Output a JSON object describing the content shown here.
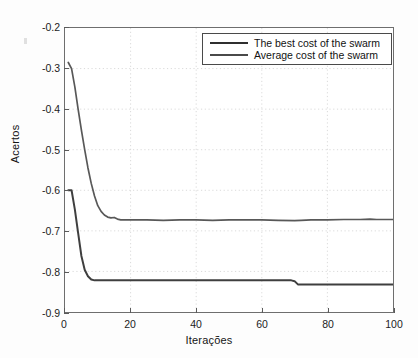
{
  "chart_data": {
    "type": "line",
    "title": "",
    "xlabel": "Iterações",
    "ylabel": "Acertos",
    "xlim": [
      0,
      100
    ],
    "ylim": [
      -0.9,
      -0.2
    ],
    "xticks": [
      0,
      20,
      40,
      60,
      80,
      100
    ],
    "yticks": [
      -0.2,
      -0.3,
      -0.4,
      -0.5,
      -0.6,
      -0.7,
      -0.8,
      -0.9
    ],
    "xtick_labels": [
      "0",
      "20",
      "40",
      "60",
      "80",
      "100"
    ],
    "ytick_labels": [
      "-0.2",
      "-0.3",
      "-0.4",
      "-0.5",
      "-0.6",
      "-0.7",
      "-0.8",
      "-0.9"
    ],
    "grid": true,
    "grid_style": "dotted",
    "legend_position": "top-right",
    "legend_boxed": true,
    "line_color": "#3c3c3c",
    "axis_color": "#6e6e6e",
    "background_color": "#ffffff",
    "series": [
      {
        "name": "The best cost of the swarm",
        "color": "#2f2f2f",
        "x": [
          1,
          2,
          3,
          4,
          5,
          6,
          7,
          8,
          9,
          10,
          12,
          15,
          20,
          25,
          30,
          35,
          40,
          45,
          50,
          55,
          60,
          65,
          69,
          70,
          71,
          75,
          80,
          85,
          90,
          95,
          100
        ],
        "values": [
          -0.6,
          -0.6,
          -0.647,
          -0.705,
          -0.762,
          -0.796,
          -0.812,
          -0.82,
          -0.822,
          -0.822,
          -0.822,
          -0.822,
          -0.822,
          -0.822,
          -0.822,
          -0.822,
          -0.822,
          -0.822,
          -0.822,
          -0.822,
          -0.822,
          -0.822,
          -0.822,
          -0.824,
          -0.832,
          -0.832,
          -0.832,
          -0.832,
          -0.832,
          -0.832,
          -0.832
        ]
      },
      {
        "name": "Average cost of the swarm",
        "color": "#4a4a4a",
        "x": [
          1,
          2,
          3,
          4,
          5,
          6,
          7,
          8,
          9,
          10,
          11,
          12,
          13,
          14,
          15,
          16,
          17,
          18,
          20,
          25,
          30,
          35,
          40,
          45,
          50,
          55,
          60,
          65,
          70,
          72,
          75,
          80,
          85,
          90,
          93,
          95,
          98,
          100
        ],
        "values": [
          -0.285,
          -0.3,
          -0.345,
          -0.4,
          -0.452,
          -0.5,
          -0.545,
          -0.583,
          -0.614,
          -0.638,
          -0.652,
          -0.661,
          -0.666,
          -0.668,
          -0.667,
          -0.671,
          -0.673,
          -0.673,
          -0.673,
          -0.673,
          -0.674,
          -0.673,
          -0.673,
          -0.674,
          -0.673,
          -0.673,
          -0.673,
          -0.674,
          -0.675,
          -0.674,
          -0.673,
          -0.673,
          -0.672,
          -0.672,
          -0.671,
          -0.672,
          -0.672,
          -0.672
        ]
      }
    ]
  },
  "legend": {
    "items": [
      {
        "label": "The best cost of the swarm"
      },
      {
        "label": "Average cost of the swarm"
      }
    ]
  },
  "axes": {
    "ylabel": "Acertos",
    "xlabel": "Iterações"
  }
}
